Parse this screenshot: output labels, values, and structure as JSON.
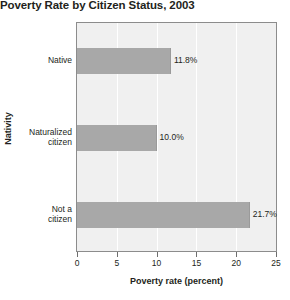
{
  "chart_data": {
    "type": "bar",
    "orientation": "horizontal",
    "title": "Poverty Rate by Citizen Status, 2003",
    "xlabel": "Poverty rate (percent)",
    "ylabel": "Nativity",
    "categories": [
      "Native",
      "Naturalized citizen",
      "Not a citizen"
    ],
    "values": [
      11.8,
      10.0,
      21.7
    ],
    "value_labels": [
      "11.8%",
      "10.0%",
      "21.7%"
    ],
    "xlim": [
      0,
      25
    ],
    "xticks": [
      0,
      5,
      10,
      15,
      20,
      25
    ],
    "xtick_labels": [
      "0",
      "5",
      "10",
      "15",
      "20",
      "25"
    ],
    "grid": "vertical",
    "legend": "none",
    "colors": {
      "bar": "#a8a8a8",
      "plot_background": "#f0f0f0",
      "gridline": "#ffffff",
      "axis": "#8c8c8c",
      "text": "#231f20",
      "page_background": "#ffffff"
    }
  }
}
